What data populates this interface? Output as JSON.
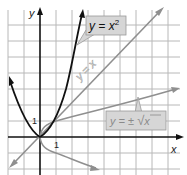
{
  "diagram": {
    "type": "function-graph",
    "axes": {
      "x_label": "x",
      "y_label": "y",
      "tick_x": "1",
      "tick_y": "1"
    },
    "curves": [
      {
        "name": "parabola",
        "label": "y = x",
        "label_sup": "2",
        "equation": "y = x^2",
        "color": "#111111"
      },
      {
        "name": "identity-line",
        "label": "y = x",
        "equation": "y = x",
        "color": "#8a8a8a"
      },
      {
        "name": "sqrt-curve",
        "label_prefix": "y = ±",
        "label_radical": "√",
        "label_radicand": "x",
        "equation": "y = ±√x",
        "color": "#8a8a8a"
      }
    ],
    "colors": {
      "grid": "#b5b5b5",
      "axis": "#111111",
      "label_box": "#d6d6d6",
      "label_box_border": "#9a9a9a"
    }
  }
}
